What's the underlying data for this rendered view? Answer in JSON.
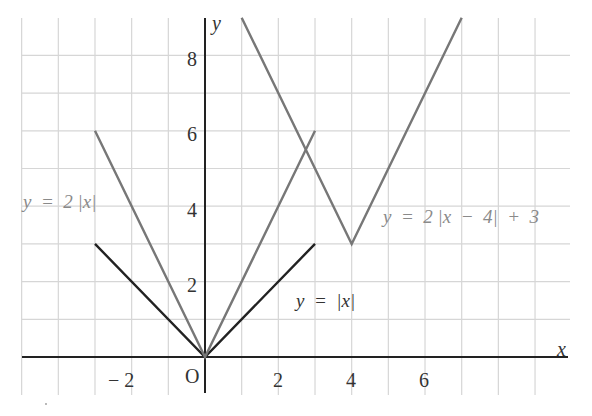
{
  "chart_data": {
    "type": "line",
    "title": "",
    "xlabel": "x",
    "ylabel": "y",
    "origin_label": "O",
    "xlim": [
      -5,
      9
    ],
    "ylim": [
      -1,
      9
    ],
    "grid": true,
    "x_ticks": [
      -2,
      2,
      4,
      6
    ],
    "x_tick_labels": [
      "− 2",
      "2",
      "4",
      "6"
    ],
    "y_ticks": [
      2,
      4,
      6,
      8
    ],
    "y_tick_labels": [
      "2",
      "4",
      "6",
      "8"
    ],
    "series": [
      {
        "name": "y = |x|",
        "color": "#222222",
        "points": [
          [
            -3,
            3
          ],
          [
            0,
            0
          ],
          [
            3,
            3
          ]
        ]
      },
      {
        "name": "y = 2 |x|",
        "color": "#777777",
        "points": [
          [
            -3,
            6
          ],
          [
            0,
            0
          ],
          [
            3,
            6
          ]
        ]
      },
      {
        "name": "y = 2 |x − 4| + 3",
        "color": "#777777",
        "points": [
          [
            1,
            9
          ],
          [
            4,
            3
          ],
          [
            7,
            9
          ]
        ]
      }
    ],
    "annotations": [
      {
        "text": "y = 2 |x|",
        "x": -5.0,
        "y": 4.2
      },
      {
        "text": "y = |x|",
        "x": 2.5,
        "y": 1.4
      },
      {
        "text": "y = 2 |x − 4| + 3",
        "x": 4.7,
        "y": 3.6
      }
    ]
  },
  "labels": {
    "x_axis": "x",
    "y_axis": "y",
    "origin": "O",
    "eq_abs_x": "y  =  |x|",
    "eq_2abs_x": "y  =  2 |x|",
    "eq_shift": "y  =  2 |x  −  4|  +  3",
    "tick_x_neg2": "− 2",
    "tick_x_2": "2",
    "tick_x_4": "4",
    "tick_x_6": "6",
    "tick_y_2": "2",
    "tick_y_4": "4",
    "tick_y_6": "6",
    "tick_y_8": "8"
  },
  "colors": {
    "grid": "#d6d6d6",
    "axis": "#222222",
    "line_dark": "#222222",
    "line_gray": "#777777"
  }
}
